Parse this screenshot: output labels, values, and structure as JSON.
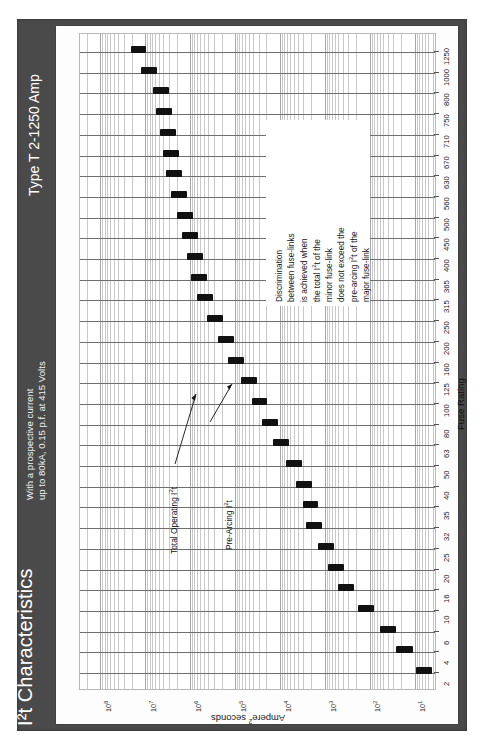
{
  "header": {
    "title": "I²t Characteristics",
    "subtitle_line1": "With a prospective current",
    "subtitle_line2": "up to 80kA, 0.15 p.f. at 415 Volts",
    "doc_type": "Type T  2-1250 Amp",
    "frame_color": "#4a4a4a",
    "title_color": "#ffffff"
  },
  "note": {
    "lines": [
      "Discrimination",
      "between fuse-links",
      "is achieved when",
      "the total I²t of the",
      "minor fuse-link",
      "does not exceed the",
      "pre-arcing I²t of the",
      "major fuse-link"
    ]
  },
  "callouts": [
    {
      "label": "Total Operating I²t"
    },
    {
      "label": "Pre-Arcing I²t"
    }
  ],
  "chart_data": {
    "type": "bar",
    "orientation": "horizontal-bands",
    "title": "I²t Characteristics",
    "xlabel": "Fuse Rating",
    "ylabel": "Ampere² seconds",
    "grid": true,
    "legend_position": "none",
    "y_scale": "log",
    "ytick_labels": [
      "10",
      "10²",
      "10³",
      "10⁴",
      "10⁵",
      "10⁶",
      "10⁷",
      "10⁸"
    ],
    "ytick_exponents": [
      1,
      2,
      3,
      4,
      5,
      6,
      7,
      8
    ],
    "ylim": [
      3,
      300000000
    ],
    "categories": [
      2,
      4,
      6,
      10,
      16,
      20,
      25,
      32,
      35,
      40,
      50,
      63,
      80,
      100,
      125,
      160,
      200,
      250,
      315,
      365,
      400,
      450,
      500,
      560,
      630,
      670,
      710,
      750,
      800,
      1000,
      1250
    ],
    "series": [
      {
        "name": "Pre-Arcing I²t",
        "values": [
          4.2,
          11,
          26,
          80,
          230,
          380,
          620,
          1150,
          1400,
          1900,
          3300,
          6200,
          11000,
          19000,
          33000,
          62000,
          105000,
          185000,
          310000,
          420000,
          520000,
          680000,
          880000,
          1150000,
          1550000,
          1800000,
          2100000,
          2500000,
          3000000,
          5500000,
          9500000
        ]
      },
      {
        "name": "Total Operating I²t",
        "values": [
          9.5,
          26,
          60,
          185,
          520,
          860,
          1400,
          2600,
          3150,
          4300,
          7400,
          14000,
          25000,
          43000,
          74000,
          140000,
          235000,
          415000,
          700000,
          950000,
          1170000,
          1530000,
          1980000,
          2600000,
          3500000,
          4050000,
          4720000,
          5600000,
          6750000,
          12400000,
          21000000
        ]
      }
    ]
  }
}
